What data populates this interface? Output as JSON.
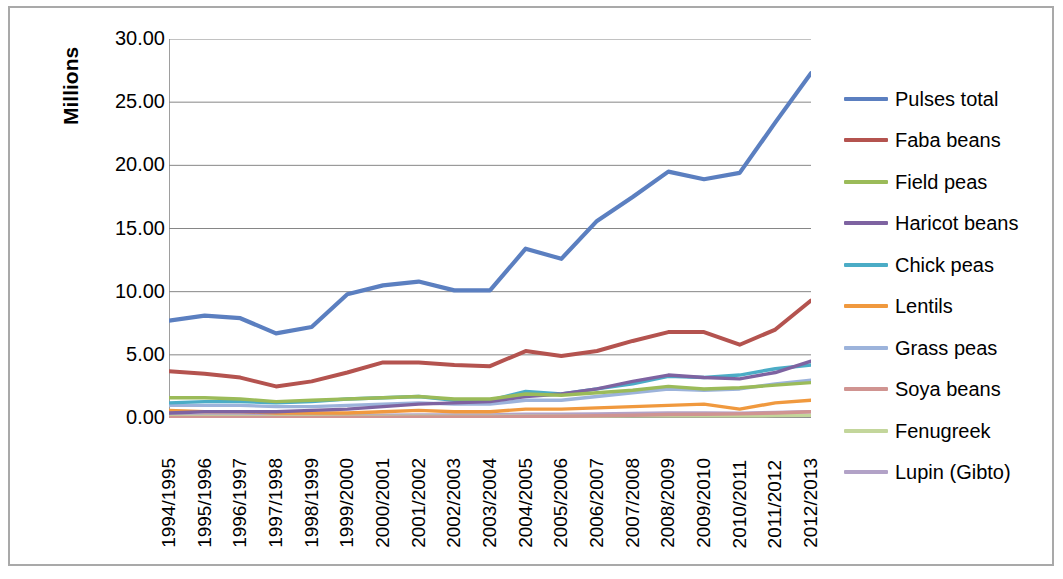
{
  "axis": {
    "y_title": "Millions",
    "y_ticks": [
      "30.00",
      "25.00",
      "20.00",
      "15.00",
      "10.00",
      "5.00",
      "0.00"
    ]
  },
  "chart_data": {
    "type": "line",
    "title": "",
    "xlabel": "",
    "ylabel": "Millions",
    "ylim": [
      0,
      30
    ],
    "ytick_step": 5,
    "grid": true,
    "legend_position": "right",
    "categories": [
      "1994/1995",
      "1995/1996",
      "1996/1997",
      "1997/1998",
      "1998/1999",
      "1999/2000",
      "2000/2001",
      "2001/2002",
      "2002/2003",
      "2003/2004",
      "2004/2005",
      "2005/2006",
      "2006/2007",
      "2007/2008",
      "2008/2009",
      "2009/2010",
      "2010/2011",
      "2011/2012",
      "2012/2013"
    ],
    "series": [
      {
        "name": "Pulses total",
        "color": "#5B7FC0",
        "values": [
          7.7,
          8.1,
          7.9,
          6.7,
          7.2,
          9.8,
          10.5,
          10.8,
          10.1,
          10.1,
          13.4,
          12.6,
          15.6,
          17.5,
          19.5,
          18.9,
          19.4,
          23.4,
          27.3
        ]
      },
      {
        "name": "Faba beans",
        "color": "#B4534F",
        "values": [
          3.7,
          3.5,
          3.2,
          2.5,
          2.9,
          3.6,
          4.4,
          4.4,
          4.2,
          4.1,
          5.3,
          4.9,
          5.3,
          6.1,
          6.8,
          6.8,
          5.8,
          7.0,
          9.3
        ]
      },
      {
        "name": "Field peas",
        "color": "#9BBB59",
        "values": [
          1.6,
          1.6,
          1.5,
          1.3,
          1.4,
          1.5,
          1.6,
          1.7,
          1.5,
          1.5,
          1.9,
          1.8,
          2.0,
          2.2,
          2.5,
          2.3,
          2.4,
          2.6,
          2.8
        ]
      },
      {
        "name": "Haricot beans",
        "color": "#7E63A1",
        "values": [
          0.4,
          0.5,
          0.5,
          0.5,
          0.6,
          0.7,
          0.9,
          1.1,
          1.2,
          1.3,
          1.7,
          1.9,
          2.3,
          2.9,
          3.4,
          3.2,
          3.1,
          3.6,
          4.5
        ]
      },
      {
        "name": "Chick peas",
        "color": "#4BACC6",
        "values": [
          1.2,
          1.3,
          1.3,
          1.2,
          1.3,
          1.5,
          1.6,
          1.7,
          1.4,
          1.4,
          2.1,
          1.9,
          2.3,
          2.7,
          3.3,
          3.2,
          3.4,
          3.9,
          4.2
        ]
      },
      {
        "name": "Lentils",
        "color": "#F0993E",
        "values": [
          0.6,
          0.5,
          0.5,
          0.4,
          0.4,
          0.4,
          0.5,
          0.6,
          0.5,
          0.5,
          0.7,
          0.7,
          0.8,
          0.9,
          1.0,
          1.1,
          0.7,
          1.2,
          1.4
        ]
      },
      {
        "name": "Grass peas",
        "color": "#9CB3DB",
        "values": [
          1.0,
          1.0,
          1.0,
          0.9,
          0.9,
          1.0,
          1.1,
          1.2,
          1.1,
          1.1,
          1.4,
          1.4,
          1.7,
          2.0,
          2.3,
          2.2,
          2.3,
          2.7,
          3.0
        ]
      },
      {
        "name": "Soya beans",
        "color": "#D09491",
        "values": [
          0.05,
          0.05,
          0.05,
          0.05,
          0.05,
          0.06,
          0.07,
          0.08,
          0.08,
          0.09,
          0.12,
          0.14,
          0.18,
          0.22,
          0.28,
          0.3,
          0.33,
          0.4,
          0.5
        ]
      },
      {
        "name": "Fenugreek",
        "color": "#C3D69B",
        "values": [
          0.12,
          0.12,
          0.12,
          0.1,
          0.11,
          0.12,
          0.13,
          0.14,
          0.12,
          0.12,
          0.15,
          0.15,
          0.16,
          0.17,
          0.18,
          0.18,
          0.17,
          0.19,
          0.21
        ]
      },
      {
        "name": "Lupin (Gibto)",
        "color": "#B2A2C7",
        "values": [
          0.18,
          0.19,
          0.2,
          0.18,
          0.19,
          0.21,
          0.23,
          0.25,
          0.24,
          0.25,
          0.3,
          0.3,
          0.33,
          0.36,
          0.4,
          0.4,
          0.38,
          0.44,
          0.5
        ]
      }
    ]
  }
}
